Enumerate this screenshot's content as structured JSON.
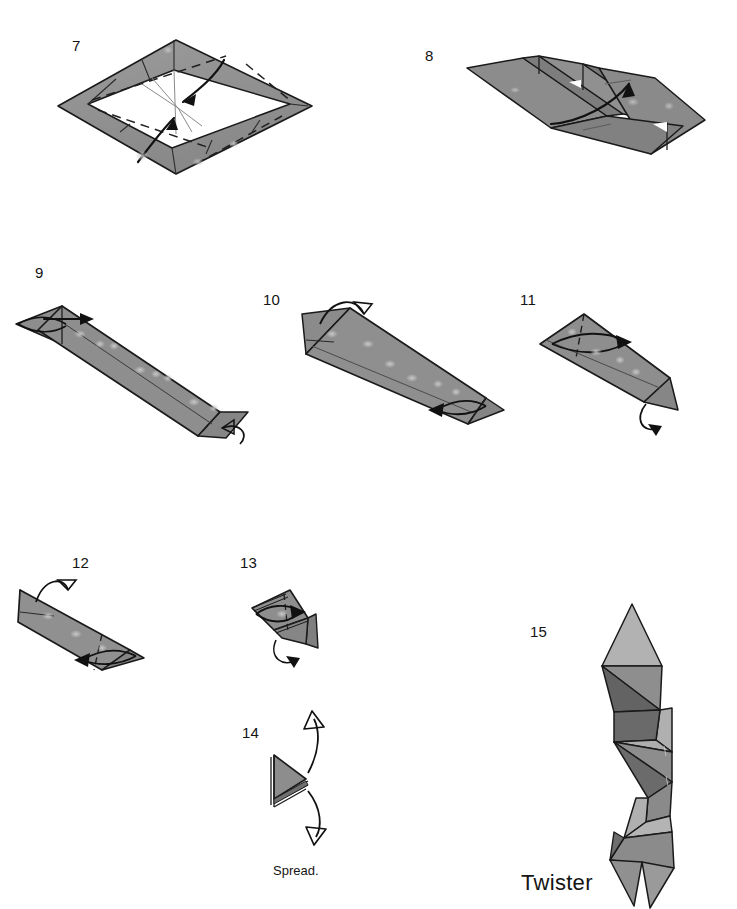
{
  "page": {
    "width": 737,
    "height": 909,
    "background": "#ffffff",
    "kind": "origami-folding-diagram"
  },
  "palette": {
    "paper_front": "#8e8e8e",
    "paper_front_light": "#b4b4b4",
    "paper_shadow": "#6e6e6e",
    "paper_dark": "#5d5d5d",
    "paper_back": "#ffffff",
    "outline": "#1a1a1a",
    "fold_line": "#2a2a2a",
    "text": "#141414"
  },
  "steps": [
    {
      "id": "step-7",
      "number": "7",
      "num_x": 72,
      "num_y": 38,
      "description": "Flat rhombus with folded gray border flaps; dashed valley folds and arrows converge on the center point."
    },
    {
      "id": "step-8",
      "number": "8",
      "num_x": 425,
      "num_y": 48,
      "description": "Three-dimensional channel / trough seen in perspective with an upward curving fold arrow."
    },
    {
      "id": "step-9",
      "number": "9",
      "num_x": 35,
      "num_y": 265,
      "description": "Long narrow band; inside reverse fold at the left tip, turn-over arrow at the lower right end."
    },
    {
      "id": "step-10",
      "number": "10",
      "num_x": 263,
      "num_y": 292,
      "description": "Long band rotated; fold-behind arrow at upper left, fold arrow pointing left at the lower right."
    },
    {
      "id": "step-11",
      "number": "11",
      "num_x": 520,
      "num_y": 292,
      "description": "Shorter band; fold arrow pointing right across the top, turn-over arrow at the lower right."
    },
    {
      "id": "step-12",
      "number": "12",
      "num_x": 72,
      "num_y": 555,
      "description": "Band shortened again; fold-behind arrow at upper left, fold arrow pointing left across the face."
    },
    {
      "id": "step-13",
      "number": "13",
      "num_x": 240,
      "num_y": 555,
      "description": "Compact folded wedge; fold arrow pointing right, turn-over arrow beneath."
    },
    {
      "id": "step-14",
      "number": "14",
      "num_x": 242,
      "num_y": 725,
      "description": "Flat layered triangle with two hollow arrows pulling apart vertically.",
      "caption": "Spread."
    },
    {
      "id": "step-15",
      "number": "15",
      "num_x": 530,
      "num_y": 624,
      "description": "Finished spiral column of triangular facets.",
      "caption": "Twister"
    }
  ],
  "captions": {
    "spread": {
      "text": "Spread.",
      "x": 273,
      "y": 864
    },
    "twister": {
      "text": "Twister",
      "x": 521,
      "y": 872
    }
  }
}
